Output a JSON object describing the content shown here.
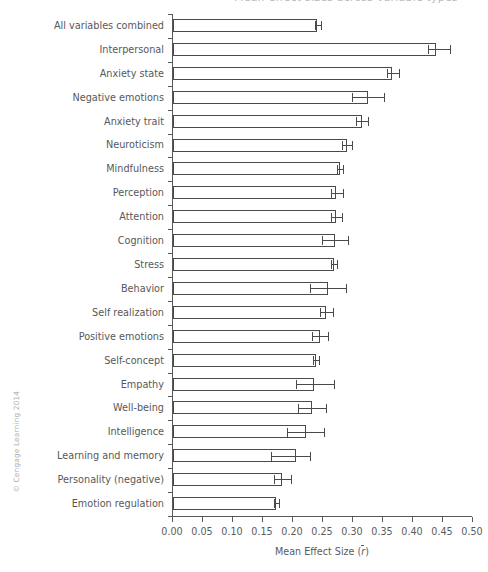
{
  "figure": {
    "top_clipped_text": "Mean effect sizes across variable types",
    "copyright": "© Cengage Learning 2014"
  },
  "chart_data": {
    "type": "bar",
    "orientation": "horizontal",
    "title": "",
    "xlabel": "Mean Effect Size (r̄)",
    "xlabel_plain": "Mean Effect Size",
    "xlabel_symbol": "r",
    "ylabel": "",
    "xlim": [
      0.0,
      0.5
    ],
    "ylim_categories": 20,
    "grid": false,
    "legend": null,
    "xticks": [
      "0.00",
      "0.05",
      "0.10",
      "0.15",
      "0.20",
      "0.25",
      "0.30",
      "0.35",
      "0.40",
      "0.45",
      "0.50"
    ],
    "xtick_values": [
      0.0,
      0.05,
      0.1,
      0.15,
      0.2,
      0.25,
      0.3,
      0.35,
      0.4,
      0.45,
      0.5
    ],
    "error_bar_style": "asymmetric confidence interval",
    "categories": [
      "All variables combined",
      "Interpersonal",
      "Anxiety state",
      "Negative emotions",
      "Anxiety trait",
      "Neuroticism",
      "Mindfulness",
      "Perception",
      "Attention",
      "Cognition",
      "Stress",
      "Behavior",
      "Self realization",
      "Positive emotions",
      "Self-concept",
      "Empathy",
      "Well-being",
      "Intelligence",
      "Learning and memory",
      "Personality (negative)",
      "Emotion regulation"
    ],
    "values": [
      0.24,
      0.438,
      0.365,
      0.325,
      0.315,
      0.29,
      0.278,
      0.272,
      0.272,
      0.27,
      0.268,
      0.258,
      0.255,
      0.245,
      0.238,
      0.235,
      0.232,
      0.222,
      0.205,
      0.182,
      0.172
    ],
    "ci_low": [
      0.236,
      0.425,
      0.357,
      0.298,
      0.305,
      0.281,
      0.274,
      0.263,
      0.263,
      0.249,
      0.264,
      0.228,
      0.245,
      0.232,
      0.233,
      0.205,
      0.209,
      0.19,
      0.163,
      0.168,
      0.168
    ],
    "ci_high": [
      0.247,
      0.462,
      0.377,
      0.352,
      0.325,
      0.299,
      0.284,
      0.283,
      0.282,
      0.291,
      0.273,
      0.288,
      0.266,
      0.258,
      0.243,
      0.268,
      0.255,
      0.252,
      0.228,
      0.197,
      0.177
    ]
  }
}
